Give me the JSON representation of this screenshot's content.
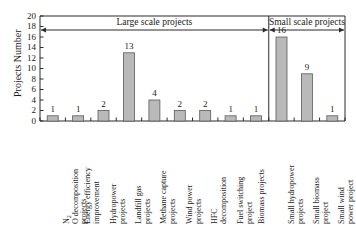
{
  "chart_data": {
    "type": "bar",
    "title": "",
    "xlabel": "",
    "ylabel": "Projects Number",
    "ylim": [
      0,
      20
    ],
    "ytick_step": 2,
    "yticks": [
      "0",
      "2",
      "4",
      "6",
      "8",
      "10",
      "12",
      "14",
      "16",
      "18",
      "20"
    ],
    "grid": false,
    "legend": "none",
    "bar_fill_color": "#b9b9b9",
    "bar_edge_color": "#5a5a5a",
    "axis_color": "#2b2b2b",
    "categories": [
      "N₂O decomposition projects",
      "Energy efficiency improvement",
      "Hydropower projects",
      "Landfill gas projects",
      "Methane capture projects",
      "Wind power projects",
      "HFC decomposition",
      "Fuel switching project",
      "Biomass projects",
      "Small hydropower projects",
      "Small biomass project",
      "Small wind power project"
    ],
    "values": [
      1,
      1,
      2,
      13,
      4,
      2,
      2,
      1,
      1,
      16,
      9,
      1
    ],
    "annotations": [
      {
        "name": "large-scale-span",
        "label": "Large scale projects",
        "from_category_index": 0,
        "to_category_index": 8,
        "arrow": "double-headed"
      },
      {
        "name": "small-scale-span",
        "label": "Small scale projects",
        "from_category_index": 9,
        "to_category_index": 11,
        "arrow": "double-headed"
      }
    ],
    "divider": {
      "name": "scale-divider",
      "between_category_indices": [
        8,
        9
      ]
    }
  },
  "category_label_lines": [
    [
      "N",
      "O decomposition",
      "projects"
    ],
    [
      "Energy efficiency",
      "improvement"
    ],
    [
      "Hydropower",
      "projects"
    ],
    [
      "Landfill gas",
      "projects"
    ],
    [
      "Methane capture",
      "projects"
    ],
    [
      "Wind power",
      "projects"
    ],
    [
      "HFC",
      "decomposition"
    ],
    [
      "Fuel switching",
      "project"
    ],
    [
      "Biomass projects"
    ],
    [
      "Small hydropower",
      "projects"
    ],
    [
      "Small biomass",
      "project"
    ],
    [
      "Small wind",
      "power project"
    ]
  ]
}
